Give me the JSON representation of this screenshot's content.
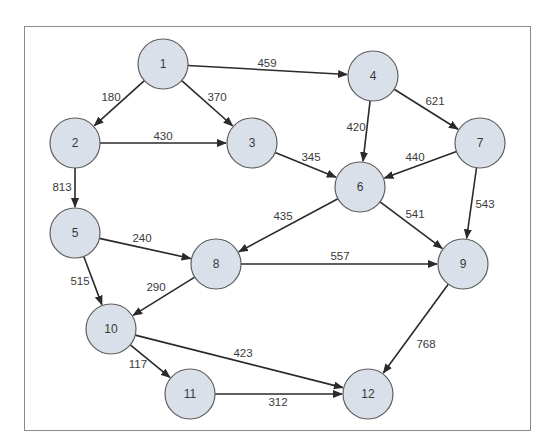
{
  "diagram": {
    "type": "directed-weighted-graph",
    "frame": {
      "x": 24,
      "y": 26,
      "width": 507,
      "height": 405,
      "border_color": "#8a8a8a"
    },
    "colors": {
      "node_fill": "#d9e0e9",
      "node_stroke": "#5f5f5f",
      "edge": "#2a2a2a",
      "text": "#3a3a3a"
    },
    "node_radius": 25,
    "nodes": [
      {
        "id": "1",
        "label": "1",
        "x": 163,
        "y": 64
      },
      {
        "id": "2",
        "label": "2",
        "x": 75,
        "y": 143
      },
      {
        "id": "3",
        "label": "3",
        "x": 252,
        "y": 143
      },
      {
        "id": "4",
        "label": "4",
        "x": 373,
        "y": 76
      },
      {
        "id": "5",
        "label": "5",
        "x": 75,
        "y": 233
      },
      {
        "id": "6",
        "label": "6",
        "x": 360,
        "y": 187
      },
      {
        "id": "7",
        "label": "7",
        "x": 480,
        "y": 143
      },
      {
        "id": "8",
        "label": "8",
        "x": 216,
        "y": 264
      },
      {
        "id": "9",
        "label": "9",
        "x": 463,
        "y": 264
      },
      {
        "id": "10",
        "label": "10",
        "x": 111,
        "y": 329
      },
      {
        "id": "11",
        "label": "11",
        "x": 190,
        "y": 394
      },
      {
        "id": "12",
        "label": "12",
        "x": 368,
        "y": 394
      }
    ],
    "edges": [
      {
        "from": "1",
        "to": "4",
        "weight": "459",
        "lx": 267,
        "ly": 63
      },
      {
        "from": "1",
        "to": "2",
        "weight": "180",
        "lx": 111,
        "ly": 97
      },
      {
        "from": "1",
        "to": "3",
        "weight": "370",
        "lx": 217,
        "ly": 97
      },
      {
        "from": "2",
        "to": "3",
        "weight": "430",
        "lx": 163,
        "ly": 136
      },
      {
        "from": "2",
        "to": "5",
        "weight": "813",
        "lx": 62,
        "ly": 187
      },
      {
        "from": "3",
        "to": "6",
        "weight": "345",
        "lx": 311,
        "ly": 157
      },
      {
        "from": "4",
        "to": "6",
        "weight": "420",
        "lx": 356,
        "ly": 127
      },
      {
        "from": "4",
        "to": "7",
        "weight": "621",
        "lx": 435,
        "ly": 101
      },
      {
        "from": "7",
        "to": "6",
        "weight": "440",
        "lx": 415,
        "ly": 157
      },
      {
        "from": "7",
        "to": "9",
        "weight": "543",
        "lx": 485,
        "ly": 204
      },
      {
        "from": "6",
        "to": "8",
        "weight": "435",
        "lx": 283,
        "ly": 216
      },
      {
        "from": "6",
        "to": "9",
        "weight": "541",
        "lx": 415,
        "ly": 214
      },
      {
        "from": "5",
        "to": "8",
        "weight": "240",
        "lx": 142,
        "ly": 238
      },
      {
        "from": "5",
        "to": "10",
        "weight": "515",
        "lx": 80,
        "ly": 281
      },
      {
        "from": "8",
        "to": "9",
        "weight": "557",
        "lx": 340,
        "ly": 256
      },
      {
        "from": "8",
        "to": "10",
        "weight": "290",
        "lx": 156,
        "ly": 287
      },
      {
        "from": "9",
        "to": "12",
        "weight": "768",
        "lx": 426,
        "ly": 344
      },
      {
        "from": "10",
        "to": "11",
        "weight": "117",
        "lx": 138,
        "ly": 364
      },
      {
        "from": "10",
        "to": "12",
        "weight": "423",
        "lx": 243,
        "ly": 353
      },
      {
        "from": "11",
        "to": "12",
        "weight": "312",
        "lx": 278,
        "ly": 402
      }
    ]
  }
}
